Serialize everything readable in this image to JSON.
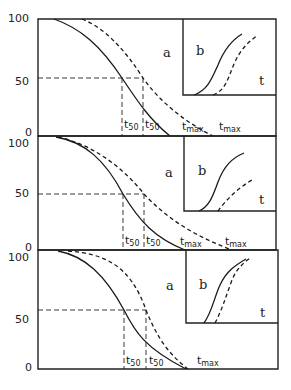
{
  "figure": {
    "panels": [
      {
        "y_ticks": [
          "100",
          "50",
          "0"
        ],
        "main_label": "a",
        "inset_label": "b",
        "inset_axis_label": "t",
        "t50_labels": [
          {
            "t": "t",
            "sub": "50"
          },
          {
            "t": "t",
            "sub": "50"
          }
        ],
        "tmax_labels": [
          {
            "t": "t",
            "sub": "max"
          },
          {
            "t": "t",
            "sub": "max"
          }
        ]
      },
      {
        "y_ticks": [
          "100",
          "50",
          "0"
        ],
        "main_label": "a",
        "inset_label": "b",
        "inset_axis_label": "t",
        "t50_labels": [
          {
            "t": "t",
            "sub": "50"
          },
          {
            "t": "t",
            "sub": "50"
          }
        ],
        "tmax_labels": [
          {
            "t": "t",
            "sub": "max"
          },
          {
            "t": "t",
            "sub": "max"
          }
        ]
      },
      {
        "y_ticks": [
          "100",
          "50",
          "0"
        ],
        "main_label": "a",
        "inset_label": "b",
        "inset_axis_label": "t",
        "t50_labels": [
          {
            "t": "t",
            "sub": "50"
          },
          {
            "t": "t",
            "sub": "50"
          }
        ],
        "tmax_labels": [
          {
            "t": "t",
            "sub": "max"
          }
        ]
      }
    ],
    "series": {
      "solid": "curve 1 (solid line)",
      "dashed": "curve 2 (dashed line)"
    },
    "colors": {
      "ink": "#1a1a1a",
      "background": "#ffffff"
    }
  }
}
